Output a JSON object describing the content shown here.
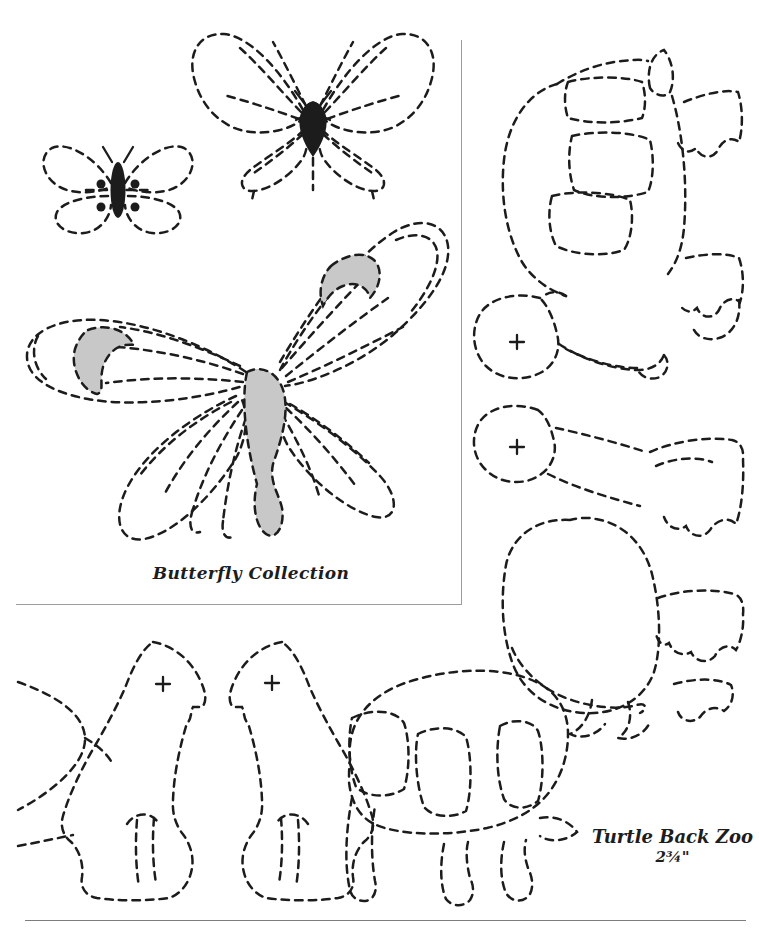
{
  "page": {
    "background": "#ffffff",
    "ink_color": "#1c1c1c",
    "shade_color": "#c8c8c8",
    "frame_color": "#9c9c9c",
    "rule_color": "#7d7d7d"
  },
  "captions": {
    "butterfly_collection": "Butterfly Collection",
    "turtle_back_zoo": "Turtle Back Zoo",
    "turtle_size": "2¾\""
  },
  "figures": [
    {
      "id": "butterfly-small"
    },
    {
      "id": "butterfly-medium"
    },
    {
      "id": "butterfly-large-shaded"
    },
    {
      "id": "turtle-side-view-upper"
    },
    {
      "id": "turtle-side-view-middle"
    },
    {
      "id": "bird-head-piece-left"
    },
    {
      "id": "bird-head-piece-right"
    },
    {
      "id": "turtle-side-view-bottom"
    },
    {
      "id": "partial-shell-arcs"
    }
  ]
}
